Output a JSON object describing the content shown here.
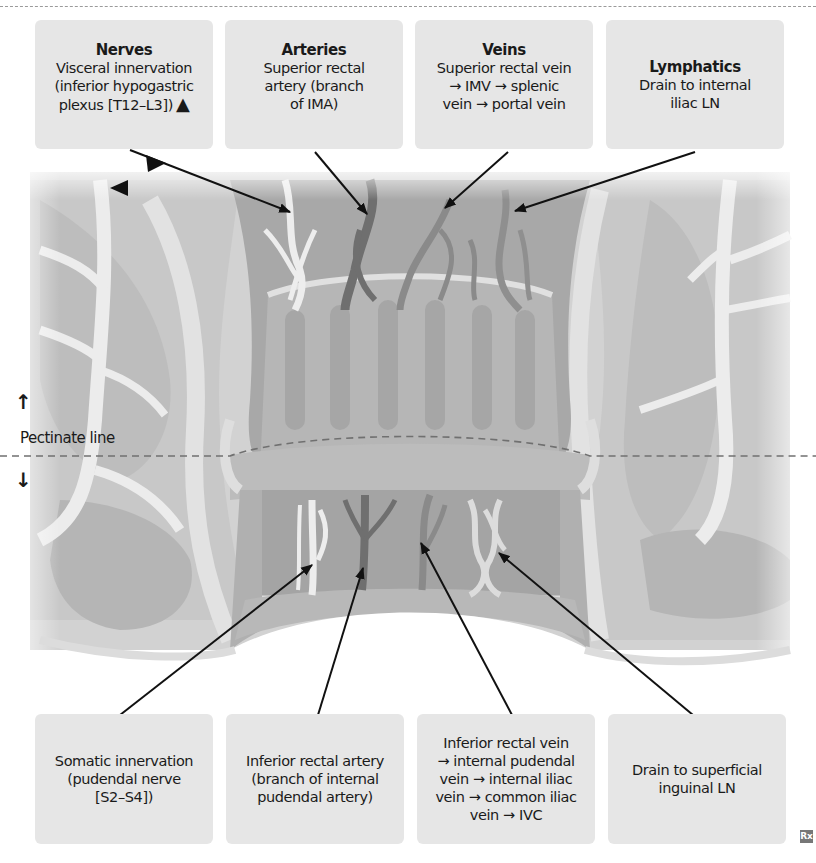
{
  "figure": {
    "divider_style": "dashed",
    "pectinate_label": "Pectinate line",
    "above_arrow": "↑",
    "below_arrow": "↓",
    "logo": "Rx",
    "colors": {
      "box_bg": "#e6e6e6",
      "tissue_light": "#ececec",
      "tissue_mid": "#c4c4c4",
      "tissue_dark": "#9e9e9e",
      "vessel_dark": "#7a7a7a",
      "leader_line": "#111111"
    }
  },
  "top_labels": [
    {
      "title": "Nerves",
      "lines": [
        "Visceral innervation",
        "(inferior hypogastric",
        "plexus [T12–L3])"
      ],
      "marker": "▲"
    },
    {
      "title": "Arteries",
      "lines": [
        "Superior rectal",
        "artery (branch",
        "of IMA)"
      ]
    },
    {
      "title": "Veins",
      "lines": [
        "Superior rectal vein",
        "→ IMV  → splenic",
        "vein → portal vein"
      ]
    },
    {
      "title": "Lymphatics",
      "lines": [
        "Drain to internal",
        "iliac LN"
      ]
    }
  ],
  "bottom_labels": [
    {
      "lines": [
        "Somatic innervation",
        "(pudendal nerve",
        "[S2–S4])"
      ]
    },
    {
      "lines": [
        "Inferior rectal artery",
        "(branch of internal",
        "pudendal artery)"
      ]
    },
    {
      "lines": [
        "Inferior rectal vein",
        "→ internal pudendal",
        "vein → internal iliac",
        "vein → common iliac",
        "vein → IVC"
      ]
    },
    {
      "lines": [
        "Drain to superficial",
        "inguinal LN"
      ]
    }
  ]
}
